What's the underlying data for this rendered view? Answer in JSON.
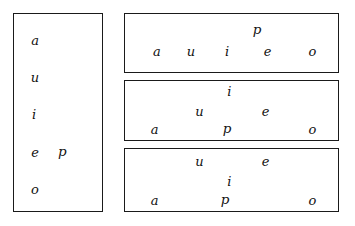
{
  "figure": {
    "background_color": "#ffffff",
    "ink_color": "#111111",
    "border_color": "#1a1a1a"
  },
  "panels": [
    {
      "id": "vertical-list",
      "name": "panel-vertical",
      "orientation": "vertical",
      "glyphs": [
        {
          "label": "a",
          "x_pct": 24,
          "y_pct": 13,
          "type": "vowel"
        },
        {
          "label": "u",
          "x_pct": 24,
          "y_pct": 32,
          "type": "vowel"
        },
        {
          "label": "i",
          "x_pct": 23,
          "y_pct": 51,
          "type": "vowel"
        },
        {
          "label": "e",
          "x_pct": 24,
          "y_pct": 70,
          "type": "vowel"
        },
        {
          "label": "p",
          "x_pct": 55,
          "y_pct": 70,
          "type": "consonant"
        },
        {
          "label": "o",
          "x_pct": 24,
          "y_pct": 89,
          "type": "vowel"
        }
      ]
    },
    {
      "id": "row-1",
      "name": "panel-row-1",
      "orientation": "horizontal",
      "glyphs": [
        {
          "label": "p",
          "x_pct": 62,
          "y_pct": 27,
          "type": "consonant"
        },
        {
          "label": "a",
          "x_pct": 15,
          "y_pct": 63,
          "type": "vowel"
        },
        {
          "label": "u",
          "x_pct": 31,
          "y_pct": 63,
          "type": "vowel"
        },
        {
          "label": "i",
          "x_pct": 48,
          "y_pct": 63,
          "type": "vowel"
        },
        {
          "label": "e",
          "x_pct": 67,
          "y_pct": 63,
          "type": "vowel"
        },
        {
          "label": "o",
          "x_pct": 88,
          "y_pct": 63,
          "type": "vowel"
        }
      ]
    },
    {
      "id": "row-2",
      "name": "panel-row-2",
      "orientation": "horizontal",
      "glyphs": [
        {
          "label": "i",
          "x_pct": 49,
          "y_pct": 17,
          "type": "vowel"
        },
        {
          "label": "u",
          "x_pct": 35,
          "y_pct": 50,
          "type": "vowel"
        },
        {
          "label": "e",
          "x_pct": 66,
          "y_pct": 50,
          "type": "vowel"
        },
        {
          "label": "a",
          "x_pct": 14,
          "y_pct": 82,
          "type": "vowel"
        },
        {
          "label": "p",
          "x_pct": 48,
          "y_pct": 82,
          "type": "consonant"
        },
        {
          "label": "o",
          "x_pct": 88,
          "y_pct": 82,
          "type": "vowel"
        }
      ]
    },
    {
      "id": "row-3",
      "name": "panel-row-3",
      "orientation": "horizontal",
      "glyphs": [
        {
          "label": "u",
          "x_pct": 35,
          "y_pct": 20,
          "type": "vowel"
        },
        {
          "label": "e",
          "x_pct": 66,
          "y_pct": 20,
          "type": "vowel"
        },
        {
          "label": "i",
          "x_pct": 49,
          "y_pct": 52,
          "type": "vowel"
        },
        {
          "label": "a",
          "x_pct": 14,
          "y_pct": 83,
          "type": "vowel"
        },
        {
          "label": "p",
          "x_pct": 47,
          "y_pct": 83,
          "type": "consonant"
        },
        {
          "label": "o",
          "x_pct": 88,
          "y_pct": 83,
          "type": "vowel"
        }
      ]
    }
  ]
}
